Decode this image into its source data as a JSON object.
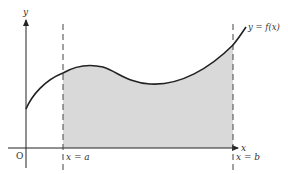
{
  "diagram": {
    "axes": {
      "x_label": "x",
      "y_label": "y",
      "origin_label": "O"
    },
    "curve": {
      "label": "y = f(x)",
      "color": "#222222"
    },
    "bounds": {
      "left_label": "x = a",
      "right_label": "x = b",
      "line_style": "dashed"
    },
    "shaded_region": {
      "color": "#d9d9d9",
      "description": "region between curve and x-axis from x = a to x = b"
    }
  }
}
